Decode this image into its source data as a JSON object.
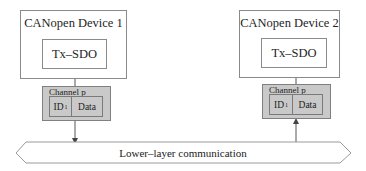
{
  "diagram": {
    "devices": [
      {
        "title": "CANopen Device 1",
        "service": "Tx–SDO",
        "channel": {
          "label": "Channel p",
          "id_label": "ID",
          "id_sub": "1",
          "data_label": "Data"
        },
        "arrow_direction": "down"
      },
      {
        "title": "CANopen Device 2",
        "service": "Tx–SDO",
        "channel": {
          "label": "Channel p",
          "id_label": "ID",
          "id_sub": "1",
          "data_label": "Data"
        },
        "arrow_direction": "up"
      }
    ],
    "bus": {
      "label": "Lower–layer communication"
    },
    "colors": {
      "channel_fill": "#c9c9c9",
      "border": "#8a8a8a",
      "bus_border": "#9a9a9a"
    }
  }
}
